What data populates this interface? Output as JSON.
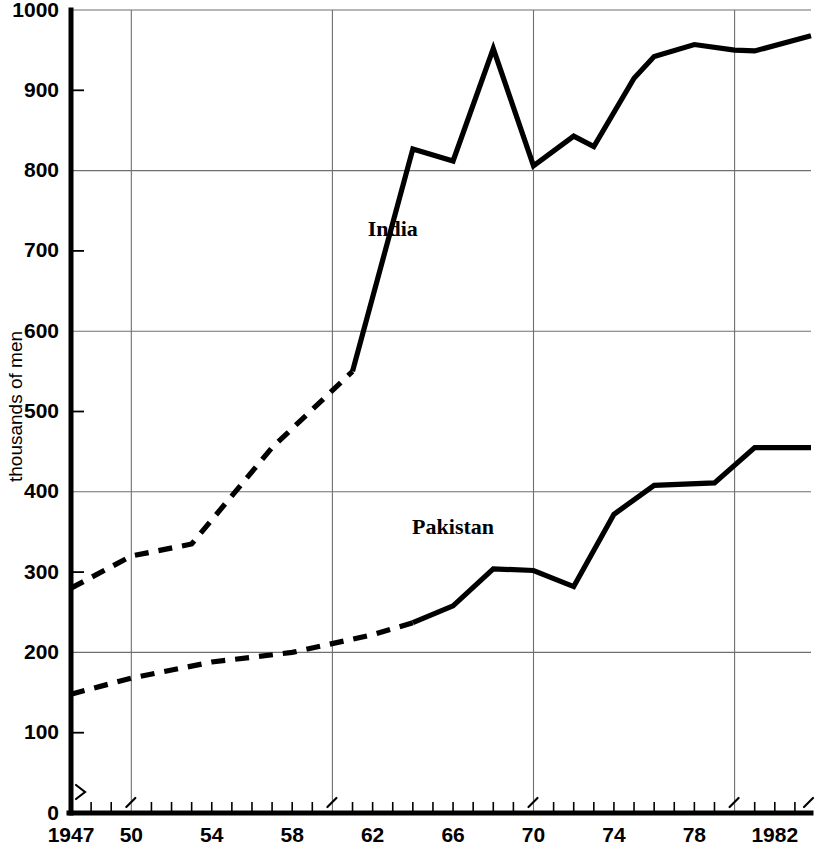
{
  "chart_data": {
    "type": "line",
    "title": "",
    "xlabel": "",
    "ylabel": "thousands of men",
    "xlim": [
      1947,
      1983.8
    ],
    "ylim": [
      0,
      1000
    ],
    "grid": true,
    "legend_position": "inline-annotation",
    "x_major_gridlines": [
      1950,
      1960,
      1970,
      1980
    ],
    "y_major_gridlines": [
      200,
      400,
      600,
      800,
      1000
    ],
    "y_minor_ticks": [
      100,
      300,
      500,
      700,
      900
    ],
    "y_tick_labels": [
      "0",
      "100",
      "200",
      "300",
      "400",
      "500",
      "600",
      "700",
      "800",
      "900",
      "1000"
    ],
    "y_tick_values": [
      0,
      100,
      200,
      300,
      400,
      500,
      600,
      700,
      800,
      900,
      1000
    ],
    "x_tick_labels": [
      "1947",
      "50",
      "54",
      "58",
      "62",
      "66",
      "70",
      "74",
      "78",
      "1982"
    ],
    "x_tick_values": [
      1947,
      1950,
      1954,
      1958,
      1962,
      1966,
      1970,
      1974,
      1978,
      1982
    ],
    "x_minor_tick_step": 1,
    "series": [
      {
        "name": "India",
        "label_x": 1963.0,
        "label_y": 718,
        "estimated_until": 1961,
        "x": [
          1947,
          1950,
          1953,
          1957,
          1961,
          1964,
          1966,
          1968,
          1970,
          1972,
          1973,
          1975,
          1976,
          1978,
          1980,
          1981,
          1983.8
        ],
        "values": [
          280,
          320,
          335,
          455,
          550,
          827,
          812,
          952,
          806,
          843,
          830,
          915,
          942,
          957,
          950,
          949,
          968
        ]
      },
      {
        "name": "Pakistan",
        "label_x": 1966.0,
        "label_y": 347,
        "estimated_until": 1964,
        "x": [
          1947,
          1950,
          1954,
          1958,
          1962,
          1964,
          1966,
          1968,
          1970,
          1972,
          1974,
          1976,
          1979,
          1981,
          1983.8
        ],
        "values": [
          148,
          168,
          188,
          200,
          222,
          237,
          258,
          304,
          302,
          282,
          372,
          408,
          411,
          455,
          455
        ]
      }
    ]
  },
  "axis": {
    "y_title": "thousands of men"
  },
  "annotations": {
    "india_label": "India",
    "pakistan_label": "Pakistan"
  }
}
